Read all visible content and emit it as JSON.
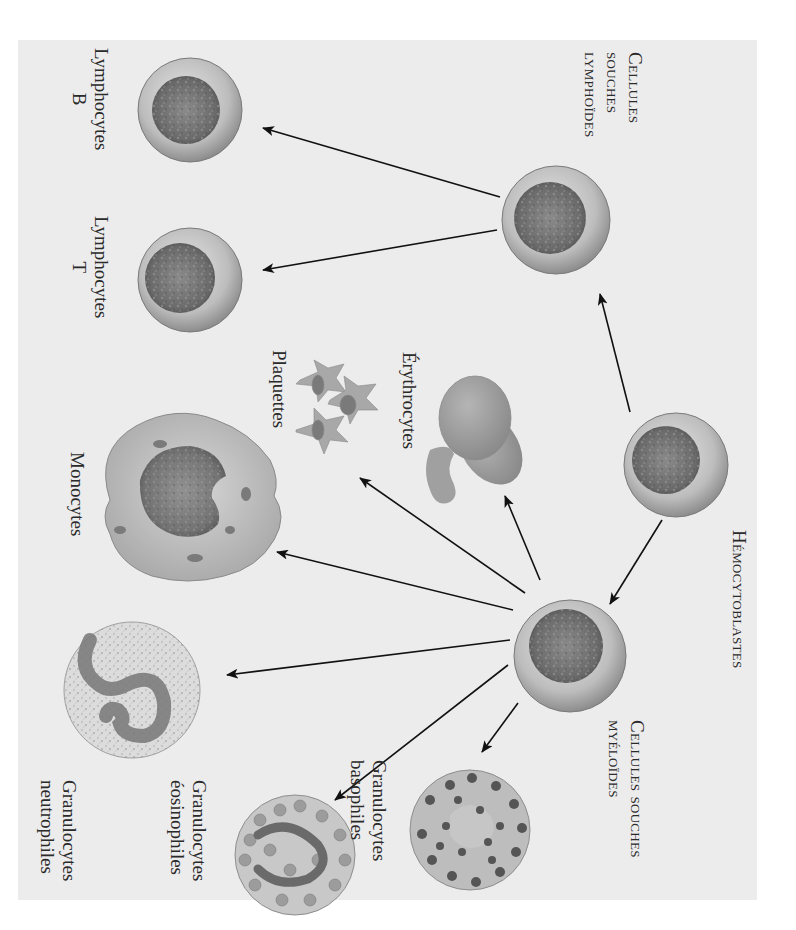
{
  "figure": {
    "orientation": "rotated 90° clockwise",
    "background_color": "#ececec"
  },
  "labels": {
    "hemocytoblastes": [
      "Hémocytoblastes"
    ],
    "cellules_souches_lymphoides": [
      "Cellules",
      "souches",
      "lymphoïdes"
    ],
    "cellules_souches_myeloides": [
      "Cellules souches",
      "myéloïdes"
    ],
    "lymphocytes_b": [
      "Lymphocytes",
      "B"
    ],
    "lymphocytes_t": [
      "Lymphocytes",
      "T"
    ],
    "erythrocytes": [
      "Érythrocytes"
    ],
    "plaquettes": [
      "Plaquettes"
    ],
    "monocytes": [
      "Monocytes"
    ],
    "granulocytes_basophiles": [
      "Granulocytes",
      "basophiles"
    ],
    "granulocytes_eosinophiles": [
      "Granulocytes",
      "éosinophiles"
    ],
    "granulocytes_neutrophiles": [
      "Granulocytes",
      "neutrophiles"
    ]
  },
  "nodes": [
    {
      "id": "hemocytoblaste",
      "label": "Hémocytoblastes",
      "icon": "stem-cell-icon"
    },
    {
      "id": "lymphoide",
      "label": "Cellules souches lymphoïdes",
      "icon": "stem-cell-icon"
    },
    {
      "id": "myeloide",
      "label": "Cellules souches myéloïdes",
      "icon": "stem-cell-icon"
    },
    {
      "id": "lymph_b",
      "label": "Lymphocytes B",
      "icon": "lymphocyte-icon"
    },
    {
      "id": "lymph_t",
      "label": "Lymphocytes T",
      "icon": "lymphocyte-icon"
    },
    {
      "id": "erythro",
      "label": "Érythrocytes",
      "icon": "red-blood-cell-icon"
    },
    {
      "id": "plaquettes",
      "label": "Plaquettes",
      "icon": "platelet-icon"
    },
    {
      "id": "monocytes",
      "label": "Monocytes",
      "icon": "monocyte-icon"
    },
    {
      "id": "basophiles",
      "label": "Granulocytes basophiles",
      "icon": "basophil-icon"
    },
    {
      "id": "eosinophiles",
      "label": "Granulocytes éosinophiles",
      "icon": "eosinophil-icon"
    },
    {
      "id": "neutrophiles",
      "label": "Granulocytes neutrophiles",
      "icon": "neutrophil-icon"
    }
  ],
  "edges": [
    {
      "from": "hemocytoblaste",
      "to": "lymphoide"
    },
    {
      "from": "hemocytoblaste",
      "to": "myeloide"
    },
    {
      "from": "lymphoide",
      "to": "lymph_b"
    },
    {
      "from": "lymphoide",
      "to": "lymph_t"
    },
    {
      "from": "myeloide",
      "to": "erythro"
    },
    {
      "from": "myeloide",
      "to": "plaquettes"
    },
    {
      "from": "myeloide",
      "to": "monocytes"
    },
    {
      "from": "myeloide",
      "to": "neutrophiles"
    },
    {
      "from": "myeloide",
      "to": "eosinophiles"
    },
    {
      "from": "myeloide",
      "to": "basophiles"
    }
  ]
}
